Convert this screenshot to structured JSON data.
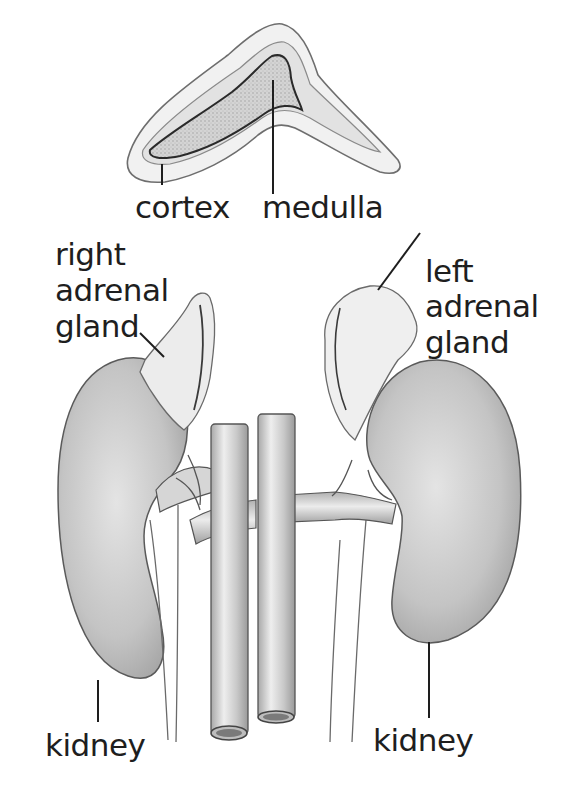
{
  "figure": {
    "colors": {
      "ink": "#1e1e1e",
      "shade_dark": "#a9a9a9",
      "shade_mid": "#c8c8c8",
      "shade_light": "#e6e6e6",
      "background": "#ffffff"
    }
  },
  "cross_section": {
    "labels": {
      "cortex": "cortex",
      "medulla": "medulla"
    }
  },
  "labels": {
    "right_adrenal": [
      "right",
      "adrenal",
      "gland"
    ],
    "left_adrenal": [
      "left",
      "adrenal",
      "gland"
    ],
    "kidney_left_side": "kidney",
    "kidney_right_side": "kidney"
  }
}
